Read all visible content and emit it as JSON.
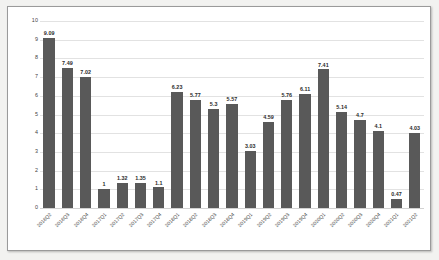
{
  "chart_data": {
    "type": "bar",
    "title": "",
    "subtitle": "",
    "xlabel": "",
    "ylabel": "",
    "ylim": [
      0,
      10
    ],
    "grid": true,
    "legend": "none",
    "bar_color": "#595959",
    "y_ticks": [
      "10",
      "9",
      "8",
      "7",
      "6",
      "5",
      "4",
      "3",
      "2",
      "1",
      "0"
    ],
    "categories": [
      "2016Q2",
      "2016Q3",
      "2016Q4",
      "2017Q1",
      "2017Q2",
      "2017Q3",
      "2017Q4",
      "2018Q1",
      "2018Q2",
      "2018Q3",
      "2018Q4",
      "2019Q1",
      "2019Q2",
      "2019Q3",
      "2019Q4",
      "2020Q1",
      "2020Q2",
      "2020Q3",
      "2020Q4",
      "2021Q1",
      "2021Q2"
    ],
    "values": [
      9.09,
      7.49,
      7.02,
      1,
      1.32,
      1.35,
      1.1,
      6.23,
      5.77,
      5.3,
      5.57,
      3.03,
      4.59,
      5.76,
      6.11,
      7.41,
      5.14,
      4.7,
      4.1,
      0.47,
      4.03
    ],
    "value_labels": [
      "9.09",
      "7.49",
      "7.02",
      "1",
      "1.32",
      "1.35",
      "1.1",
      "6.23",
      "5.77",
      "5.3",
      "5.57",
      "3.03",
      "4.59",
      "5.76",
      "6.11",
      "7.41",
      "5.14",
      "4.7",
      "4.1",
      "0.47",
      "4.03"
    ]
  }
}
